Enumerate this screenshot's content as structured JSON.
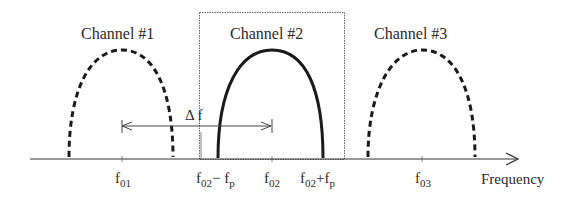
{
  "diagram": {
    "axis": {
      "label": "Frequency"
    },
    "channels": [
      {
        "label": "Channel #1",
        "center": "f01",
        "style": "dashed"
      },
      {
        "label": "Channel #2",
        "center": "f02",
        "style": "solid",
        "highlighted": true
      },
      {
        "label": "Channel #3",
        "center": "f03",
        "style": "dashed"
      }
    ],
    "spacing": {
      "label": "Δ f"
    },
    "ticks": [
      {
        "base": "f",
        "sub": "01",
        "suffix": ""
      },
      {
        "base": "f",
        "sub": "02",
        "suffix": "− f",
        "suffix_sub": "p"
      },
      {
        "base": "f",
        "sub": "02",
        "suffix": ""
      },
      {
        "base": "f",
        "sub": "02",
        "suffix": "+f",
        "suffix_sub": "p"
      },
      {
        "base": "f",
        "sub": "03",
        "suffix": ""
      }
    ],
    "colors": {
      "line": "#1a1a1a",
      "text": "#2a2a2a",
      "box": "#555555"
    }
  }
}
